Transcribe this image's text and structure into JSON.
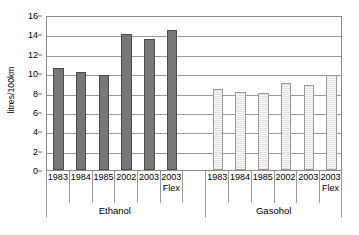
{
  "chart_data": {
    "type": "bar",
    "title": "",
    "subtitle": "",
    "xlabel": "",
    "ylabel": "litres/100km",
    "ylim": [
      0,
      16
    ],
    "ytick_step": 2,
    "yticks": [
      0,
      2,
      4,
      6,
      8,
      10,
      12,
      14,
      16
    ],
    "grid": "horizontal",
    "legend": "none",
    "categories": [
      "1983",
      "1984",
      "1985",
      "2002",
      "2003",
      "2003 Flex"
    ],
    "category_lines": [
      [
        "1983",
        ""
      ],
      [
        "1984",
        ""
      ],
      [
        "1985",
        ""
      ],
      [
        "2002",
        ""
      ],
      [
        "2003",
        ""
      ],
      [
        "2003",
        "Flex"
      ]
    ],
    "groups": [
      "Ethanol",
      "Gasohol"
    ],
    "series": [
      {
        "name": "Ethanol",
        "color": "#777777",
        "values": [
          10.5,
          10.1,
          9.8,
          14.0,
          13.5,
          14.5
        ]
      },
      {
        "name": "Gasohol",
        "color": "#f1f1f1",
        "values": [
          8.4,
          8.1,
          7.9,
          9.0,
          8.8,
          9.8
        ]
      }
    ]
  },
  "colors": {
    "ethanol_fill": "#777777",
    "ethanol_stroke": "#4d4d4d",
    "gasohol_fill": "#f1f1f1",
    "gasohol_stroke": "#9b9b9b",
    "gridline": "#9a9a9a",
    "frame": "#8a8a8a",
    "text": "#000000",
    "background": "#ffffff"
  }
}
